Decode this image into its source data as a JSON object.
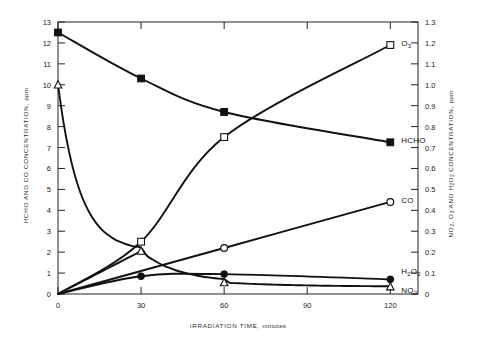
{
  "chart_data": {
    "type": "line",
    "title": "",
    "xlabel_text": "IRRADIATION TIME,",
    "xlabel_unit": "minutes",
    "ylabel_left_text": "HCHO AND CO CONCENTRATION,",
    "ylabel_left_unit": "ppm",
    "ylabel_right_prefix": "NO",
    "ylabel_right_sub1": "2",
    "ylabel_right_mid": ", O",
    "ylabel_right_sub2": "3",
    "ylabel_right_mid2": " AND H",
    "ylabel_right_sub3": "2",
    "ylabel_right_mid3": "O",
    "ylabel_right_sub4": "2",
    "ylabel_right_suffix": " CONCENTRATION,",
    "ylabel_right_unit": "ppm",
    "xlim": [
      0,
      130
    ],
    "xticks": [
      0,
      30,
      60,
      90,
      120
    ],
    "xticklabels": [
      "0",
      "30",
      "60",
      "90",
      "120"
    ],
    "ylim_left": [
      0,
      13
    ],
    "yticks_left": [
      0,
      1,
      2,
      3,
      4,
      5,
      6,
      7,
      8,
      9,
      10,
      11,
      12,
      13
    ],
    "yticklabels_left": [
      "0",
      "1",
      "2",
      "3",
      "4",
      "5",
      "6",
      "7",
      "8",
      "9",
      "10",
      "11",
      "12",
      "13"
    ],
    "ylim_right": [
      0,
      1.3
    ],
    "yticks_right": [
      0,
      0.1,
      0.2,
      0.3,
      0.4,
      0.5,
      0.6,
      0.7,
      0.8,
      0.9,
      1.0,
      1.1,
      1.2,
      1.3
    ],
    "yticklabels_right": [
      "0",
      "0.1",
      "0.2",
      "0.3",
      "0.4",
      "0.5",
      "0.6",
      "0.7",
      "0.8",
      "0.9",
      "1.0",
      "1.1",
      "1.2",
      "1.3"
    ],
    "grid": false,
    "legend_position": "right-inline-labels",
    "series": [
      {
        "name": "HCHO",
        "label": "HCHO",
        "axis": "left",
        "marker": "filled-square",
        "x": [
          0,
          30,
          60,
          120
        ],
        "y": [
          12.5,
          10.3,
          8.7,
          7.25
        ],
        "label_x": 120,
        "label_y": 7.25
      },
      {
        "name": "CO",
        "label": "CO",
        "axis": "left",
        "marker": "open-circle",
        "x": [
          0,
          60,
          120
        ],
        "y": [
          0.0,
          2.2,
          4.4
        ],
        "label_x": 120,
        "label_y": 4.4
      },
      {
        "name": "O3",
        "label": "O",
        "label_sub": "3",
        "axis": "right",
        "marker": "open-square",
        "x": [
          0,
          30,
          60,
          120
        ],
        "y": [
          0.0,
          0.25,
          0.75,
          1.19
        ],
        "label_x": 120,
        "label_y": 1.19
      },
      {
        "name": "H2O2",
        "label": "H",
        "label_sub": "2",
        "label_mid": "O",
        "label_sub2": "2",
        "axis": "right",
        "marker": "filled-circle",
        "x": [
          0,
          30,
          60,
          120
        ],
        "y": [
          0.0,
          0.085,
          0.095,
          0.07
        ],
        "label_x": 120,
        "label_y": 0.085
      },
      {
        "name": "NO2",
        "label": "NO",
        "label_sub": "2",
        "axis": "right",
        "marker": "open-triangle",
        "x": [
          0,
          30,
          60,
          120
        ],
        "y": [
          1.0,
          0.205,
          0.055,
          0.035
        ],
        "label_x": 120,
        "label_y": 0.035,
        "note": "NO2 decays steeply from 1.0 ppm; also rising branch from origin merges near t=30"
      }
    ],
    "colors": {
      "line": "#111111",
      "axis": "#222222",
      "text": "#1a1a1a",
      "background": "#ffffff"
    }
  }
}
